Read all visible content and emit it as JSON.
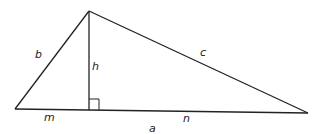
{
  "diagram": {
    "type": "right-triangle-altitude",
    "stroke_color": "#222222",
    "background": "#ffffff",
    "labels": {
      "b": "b",
      "c": "c",
      "h": "h",
      "m": "m",
      "n": "n",
      "a": "a"
    },
    "vertices": {
      "left": [
        15,
        109
      ],
      "top": [
        89,
        11
      ],
      "right": [
        308,
        113
      ],
      "foot": [
        89,
        110
      ]
    },
    "right_angle_marker": true
  }
}
